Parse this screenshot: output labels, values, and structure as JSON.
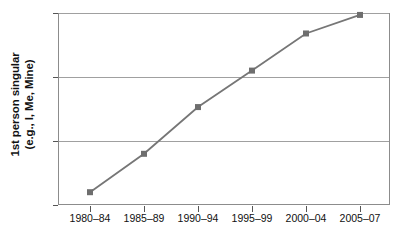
{
  "chart_data": {
    "type": "line",
    "title": "",
    "xlabel": "",
    "ylabel": "1st person singular (e.g., I, Me, Mine)",
    "ylabel_line1": "1st person singular",
    "ylabel_line2": "(e.g., I, Me, Mine)",
    "categories": [
      "1980–84",
      "1985–89",
      "1990–94",
      "1995–99",
      "2000–04",
      "2005–07"
    ],
    "values": [
      10.2,
      10.8,
      11.53,
      12.1,
      12.68,
      12.97
    ],
    "ylim": [
      10,
      13
    ],
    "yticks": [
      10,
      11,
      12,
      13
    ],
    "ytick_labels": [
      "10",
      "11",
      "12",
      "13"
    ],
    "grid": true,
    "grid_axis": "y",
    "legend": "none",
    "series": [
      {
        "name": "1st person singular",
        "values": [
          10.2,
          10.8,
          11.53,
          12.1,
          12.68,
          12.97
        ],
        "color": "#767676",
        "marker": "square",
        "marker_color": "#6e6e6e"
      }
    ],
    "colors": {
      "line": "#767676",
      "marker": "#6e6e6e",
      "gridline": "#a0a0a0",
      "frame": "#8c8c8c",
      "text": "#111111"
    }
  }
}
